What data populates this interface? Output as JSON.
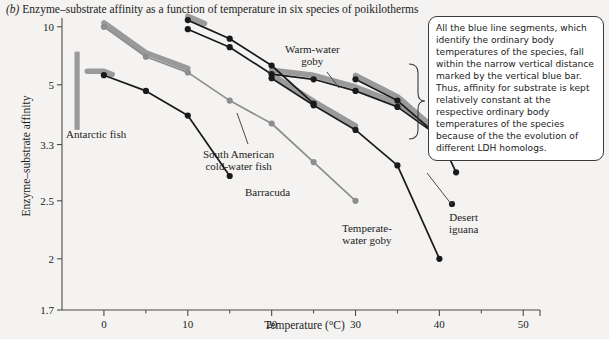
{
  "figure": {
    "panel_label": "(b)",
    "title": "Enzyme–substrate affinity as a function of temperature in six species of poikilotherms",
    "annotation": "All the blue line segments, which identify the ordinary body temperatures of the species, fall within the narrow vertical distance marked by the vertical blue bar. Thus, affinity for substrate is kept relatively constant at the respective ordinary body temperatures of the species because of the the evolution of different LDH homologs."
  },
  "colors": {
    "line": "#1a1a1a",
    "highlight": "#9a9a9a",
    "bar": "#9a9a9a",
    "axis": "#4a4a4a",
    "background": "#f4f3f1",
    "annotation_bg": "#ffffff",
    "annotation_border": "#3a3a3a"
  },
  "chart_data": {
    "type": "line",
    "title": "Enzyme–substrate affinity as a function of temperature in six species of poikilotherms",
    "xlabel": "Temperature (°C)",
    "ylabel": "Enzyme–substrate affinity",
    "xlim": [
      -5,
      52
    ],
    "xticks": [
      0,
      10,
      20,
      30,
      40,
      50
    ],
    "xminorticks": [
      5,
      15,
      25,
      35,
      45
    ],
    "yticks": [
      10,
      5,
      3.3,
      2.5,
      2,
      1.7
    ],
    "ytick_labels": [
      "10",
      "5",
      "3.3",
      "2.5",
      "2",
      "1.7"
    ],
    "yscale": "reciprocal",
    "grid": false,
    "legend": "none",
    "reference_bar": {
      "name": "vertical blue bar",
      "x": -3.2,
      "y_top": 7.0,
      "y_bottom": 3.6,
      "color": "#9a9a9a"
    },
    "series": [
      {
        "name": "Barracuda",
        "points": [
          [
            0,
            10.0
          ],
          [
            5,
            6.6
          ],
          [
            10,
            5.6
          ],
          [
            15,
            4.4
          ],
          [
            20,
            3.75
          ],
          [
            25,
            3.0
          ],
          [
            30,
            2.5
          ]
        ],
        "highlight_from": 0,
        "highlight_to": 10,
        "label": "Barracuda",
        "label_x": 245,
        "label_y": 186,
        "leader": null
      },
      {
        "name": "Antarctic fish",
        "points": [
          [
            0,
            5.45
          ],
          [
            5,
            4.75
          ],
          [
            10,
            3.95
          ],
          [
            15,
            2.8
          ]
        ],
        "highlight_from": -2,
        "highlight_to": 1,
        "label": "Antarctic fish",
        "label_x": 66,
        "label_y": 128,
        "leader": null
      },
      {
        "name": "South American cold-water fish",
        "points": [
          [
            10,
            11.3
          ],
          [
            15,
            8.3
          ],
          [
            20,
            6.0
          ],
          [
            25,
            4.3
          ]
        ],
        "highlight_from": 10,
        "highlight_to": 12,
        "label": "South American\ncold-water fish",
        "label_x": 203,
        "label_y": 148,
        "leader": [
          [
            248,
            144
          ],
          [
            237,
            113
          ]
        ]
      },
      {
        "name": "Warm-water goby",
        "points": [
          [
            10,
            9.6
          ],
          [
            15,
            7.4
          ],
          [
            20,
            5.5
          ],
          [
            25,
            5.25
          ],
          [
            30,
            4.75
          ],
          [
            35,
            4.2
          ],
          [
            40,
            3.45
          ]
        ],
        "highlight_from": 20,
        "highlight_to": 40,
        "label": "Warm-water\ngoby",
        "label_x": 285,
        "label_y": 43,
        "leader": [
          [
            327,
            72
          ],
          [
            339,
            88
          ]
        ]
      },
      {
        "name": "Temperate-water goby",
        "points": [
          [
            20,
            5.3
          ],
          [
            25,
            4.25
          ],
          [
            30,
            3.6
          ],
          [
            35,
            2.95
          ],
          [
            40,
            2.0
          ]
        ],
        "highlight_from": 20,
        "highlight_to": 30,
        "label": "Temperate-\nwater goby",
        "label_x": 342,
        "label_y": 222,
        "leader": null
      },
      {
        "name": "Desert iguana",
        "points": [
          [
            30,
            5.25
          ],
          [
            35,
            4.4
          ],
          [
            40,
            3.45
          ],
          [
            42,
            2.85
          ]
        ],
        "highlight_from": 30,
        "highlight_to": 40,
        "label": "Desert\niguana",
        "label_x": 449,
        "label_y": 211,
        "leader": [
          [
            452,
            205
          ],
          [
            427,
            173
          ]
        ]
      }
    ]
  }
}
